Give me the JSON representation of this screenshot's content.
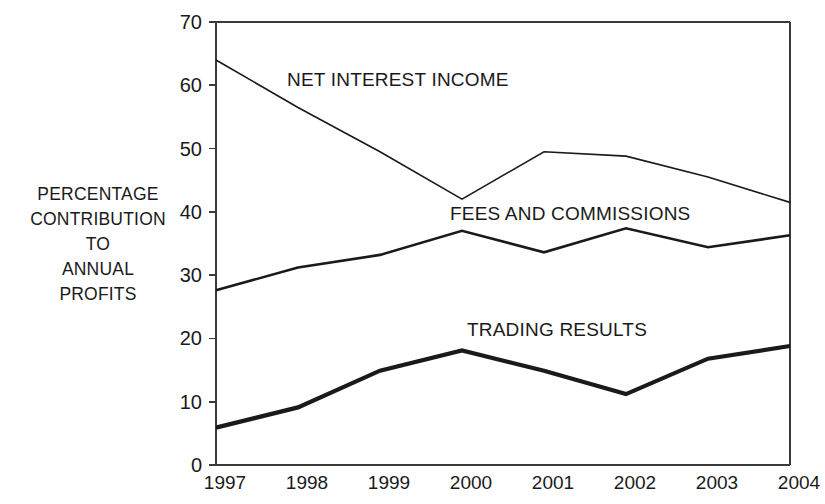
{
  "chart_data": {
    "type": "line",
    "title": "",
    "xlabel": "",
    "ylabel": "PERCENTAGE CONTRIBUTION TO ANNUAL PROFITS",
    "ylabel_lines": [
      "PERCENTAGE",
      "CONTRIBUTION",
      "TO",
      "ANNUAL",
      "PROFITS"
    ],
    "categories": [
      "1997",
      "1998",
      "1999",
      "2000",
      "2001",
      "2002",
      "2003",
      "2004"
    ],
    "x_tick_labels": [
      "1997",
      "1998",
      "1999",
      "2000",
      "2001",
      "2002",
      "2003",
      "2004"
    ],
    "y_tick_labels": [
      "70",
      "60",
      "50",
      "40",
      "30",
      "20",
      "10",
      "0"
    ],
    "y_ticks": [
      0,
      10,
      20,
      30,
      40,
      50,
      60,
      70
    ],
    "ylim": [
      0,
      70
    ],
    "grid": false,
    "legend_position": "inline-labels",
    "series": [
      {
        "name": "NET INTEREST INCOME",
        "label": "NET INTEREST INCOME",
        "color": "#1a1a1a",
        "line_width": 1.6,
        "values": [
          64.0,
          56.5,
          49.5,
          42.0,
          49.5,
          48.8,
          45.5,
          41.5
        ]
      },
      {
        "name": "FEES AND COMMISSIONS",
        "label": "FEES AND COMMISSIONS",
        "color": "#1a1a1a",
        "line_width": 2.6,
        "values": [
          27.6,
          31.2,
          33.2,
          37.0,
          33.6,
          37.4,
          34.4,
          36.3
        ]
      },
      {
        "name": "TRADING RESULTS",
        "label": "TRADING RESULTS",
        "color": "#1a1a1a",
        "line_width": 4.2,
        "values": [
          5.9,
          9.1,
          14.9,
          18.1,
          14.9,
          11.2,
          16.8,
          18.8
        ]
      }
    ],
    "axis_color": "#3a3a3a",
    "background_color": "#ffffff"
  },
  "geometry": {
    "plot_left": 216,
    "plot_right": 790,
    "plot_top": 22,
    "plot_bottom": 465,
    "y_min": 0,
    "y_max": 70
  }
}
